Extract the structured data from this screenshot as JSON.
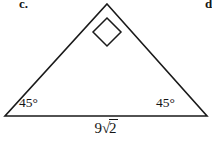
{
  "figure": {
    "problem_letter": "c.",
    "next_problem_letter": "d.",
    "shape": "right-triangle",
    "background_color": "#ffffff",
    "stroke_color": "#1a1a1a",
    "vertices": {
      "apex": [
        107,
        4
      ],
      "bottom_left": [
        5,
        116
      ],
      "bottom_right": [
        207,
        116
      ]
    },
    "right_angle_marker": {
      "at": "apex",
      "style": "rotated-square"
    },
    "angles": {
      "bottom_left": "45°",
      "bottom_right": "45°",
      "apex": "90°"
    },
    "side_labels": {
      "base": {
        "coefficient": "9",
        "radical_sign": "√",
        "radicand": "2",
        "full": "9√2"
      }
    }
  }
}
